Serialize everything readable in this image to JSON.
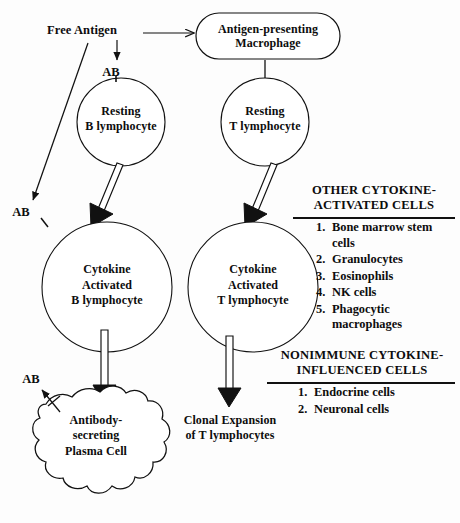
{
  "diagram": {
    "ink_color": "#111111",
    "background": "#ffffff",
    "nodes": {
      "free_antigen": "Free Antigen",
      "macrophage": "Antigen-presenting\nMacrophage",
      "resting_b": "Resting\nB lymphocyte",
      "resting_t": "Resting\nT lymphocyte",
      "activated_b": "Cytokine\nActivated\nB lymphocyte",
      "activated_t": "Cytokine\nActivated\nT lymphocyte",
      "plasma_cell": "Antibody-\nsecreting\nPlasma Cell",
      "clonal_expansion": "Clonal Expansion\nof T lymphocytes"
    },
    "receptor_labels": {
      "ab_resting_b": "AB",
      "ab_activated_b": "AB",
      "ab_plasma": "AB"
    },
    "panels": [
      {
        "id": "other-cytokine-activated-cells",
        "heading": "OTHER  CYTOKINE-\nACTIVATED CELLS",
        "items": [
          {
            "num": "1.",
            "text": "Bone marrow stem cells"
          },
          {
            "num": "2.",
            "text": "Granulocytes"
          },
          {
            "num": "3.",
            "text": "Eosinophils"
          },
          {
            "num": "4.",
            "text": "NK cells"
          },
          {
            "num": "5.",
            "text": "Phagocytic macrophages"
          }
        ]
      },
      {
        "id": "nonimmune-cytokine-influenced-cells",
        "heading": "NONIMMUNE  CYTOKINE-\nINFLUENCED CELLS",
        "items": [
          {
            "num": "1.",
            "text": "Endocrine cells"
          },
          {
            "num": "2.",
            "text": "Neuronal cells"
          }
        ]
      }
    ]
  }
}
